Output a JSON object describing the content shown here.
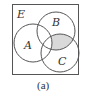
{
  "diagram": {
    "type": "venn",
    "universe_label": "E",
    "sets": [
      {
        "label": "A"
      },
      {
        "label": "B"
      },
      {
        "label": "C"
      }
    ],
    "shaded_region": "B ∩ C ∩ A'",
    "shade_color": "#d9d9d9",
    "line_color": "#555555",
    "caption": "(a)"
  }
}
